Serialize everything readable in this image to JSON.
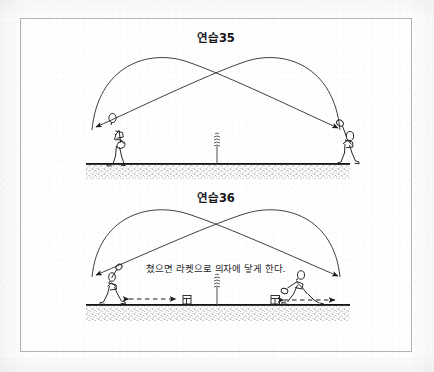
{
  "page": {
    "background_color": "#fefefe",
    "frame_color": "#b3b3b3",
    "ink_color": "#1d1d1f"
  },
  "panels": [
    {
      "id": "exercise-35",
      "title": "연습35",
      "caption": "",
      "elements": {
        "ground_label": "court-ground",
        "net_label": "center-net-post",
        "left_player_label": "tennis-player-left",
        "right_player_label": "tennis-player-right",
        "trajectory_1_label": "ball-trajectory-left-to-right",
        "trajectory_2_label": "ball-trajectory-right-to-left"
      }
    },
    {
      "id": "exercise-36",
      "title": "연습36",
      "caption": "쳤으면 라켓으로 의자에 닿게 한다.",
      "elements": {
        "ground_label": "court-ground",
        "net_label": "center-net-post",
        "left_player_label": "tennis-player-left",
        "right_player_label": "tennis-player-right-lunging",
        "left_chair_label": "target-chair-left",
        "right_chair_label": "target-chair-right",
        "left_movement_label": "movement-arrow-left",
        "right_movement_label": "movement-arrow-right",
        "trajectory_1_label": "ball-trajectory-left-to-right",
        "trajectory_2_label": "ball-trajectory-right-to-left"
      }
    }
  ]
}
